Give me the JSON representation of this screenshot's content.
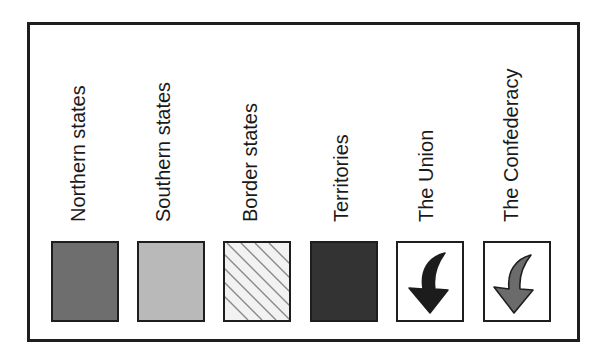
{
  "legend": {
    "items": [
      {
        "label": "Northern states",
        "symbol": "solid-fill",
        "color": "#6e6e6e"
      },
      {
        "label": "Southern states",
        "symbol": "solid-fill",
        "color": "#b9b9b9"
      },
      {
        "label": "Border states",
        "symbol": "diagonal-hatch",
        "color": "#f2f2f2",
        "hatch_color": "#8a8a8a"
      },
      {
        "label": "Territories",
        "symbol": "solid-fill",
        "color": "#333333"
      },
      {
        "label": "The Union",
        "symbol": "curved-arrow-down",
        "color": "#1c1c1c"
      },
      {
        "label": "The Confederacy",
        "symbol": "curved-arrow-down",
        "color": "#6b6b6b"
      }
    ]
  }
}
